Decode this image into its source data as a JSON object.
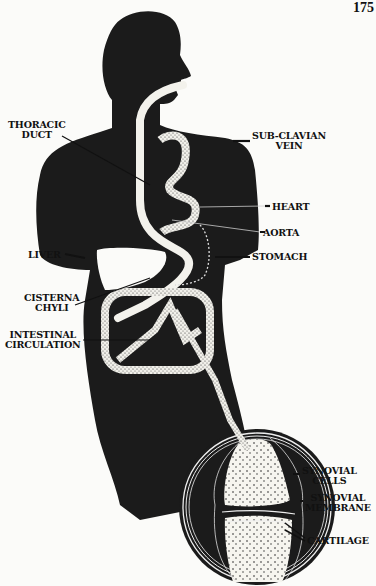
{
  "page": {
    "number": "175"
  },
  "figure": {
    "colors": {
      "silhouette": "#1a1a1a",
      "paper": "#fbfbf9",
      "vessel": "#f4f3ee",
      "stipple": "#2a2a2a"
    }
  },
  "labels": {
    "thoracic_duct": [
      "THORACIC",
      "DUCT"
    ],
    "sub_clavian_vein": [
      "SUB-CLAVIAN",
      "VEIN"
    ],
    "heart": "HEART",
    "aorta": "AORTA",
    "liver": "LIVER",
    "stomach": "STOMACH",
    "cisterna_chyli": [
      "CISTERNA",
      "CHYLI"
    ],
    "intestinal_circulation": [
      "INTESTINAL",
      "CIRCULATION"
    ],
    "synovial_cells": [
      "SYNOVIAL",
      "CELLS"
    ],
    "synovial_membrane": [
      "SYNOVIAL",
      "MEMBRANE"
    ],
    "cartilage": "CARTILAGE"
  }
}
